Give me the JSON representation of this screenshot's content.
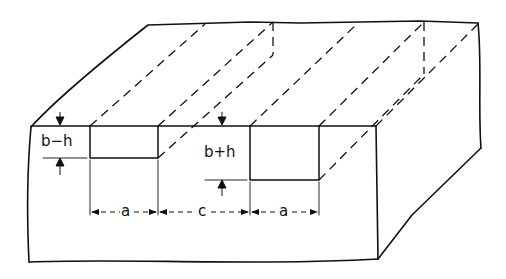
{
  "diagram": {
    "type": "isometric block with two rectangular grooves",
    "labels": {
      "groove1_depth": "b−h",
      "groove2_depth": "b+h",
      "width1": "a",
      "spacing": "c",
      "width2": "a"
    },
    "colors": {
      "line": "#111111",
      "background": "#ffffff"
    }
  }
}
